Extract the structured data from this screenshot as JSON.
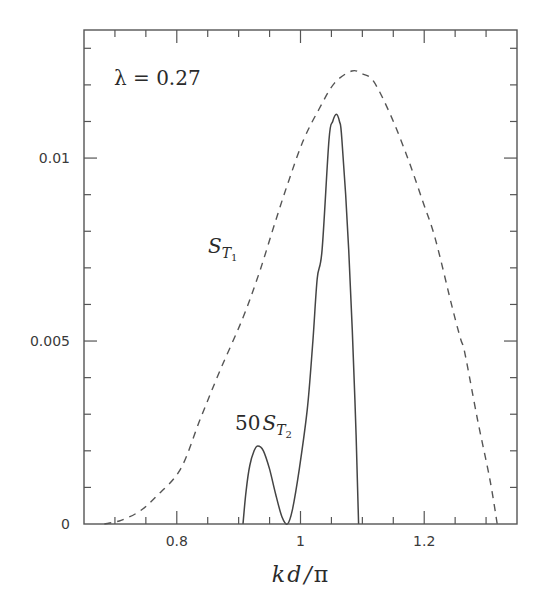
{
  "chart_data": {
    "type": "line",
    "title": "",
    "annotation": "λ = 0.27",
    "xlabel": "kd/π",
    "ylabel": "",
    "xlim": [
      0.65,
      1.35
    ],
    "ylim": [
      0,
      0.0135
    ],
    "grid": false,
    "legend": "none (inline curve labels)",
    "x_major_ticks": [
      0.8,
      1.0,
      1.2
    ],
    "x_tick_labels": [
      "0.8",
      "1",
      "1.2"
    ],
    "x_minor_step": 0.05,
    "y_major_ticks": [
      0,
      0.005,
      0.01
    ],
    "y_tick_labels": [
      "0",
      "0.005",
      "0.01"
    ],
    "y_minor_step": 0.001,
    "series": [
      {
        "name": "S_T1",
        "label_main": "S",
        "label_sub_letter": "T",
        "label_sub_index": "1",
        "style": "dashed",
        "points": [
          [
            0.683,
            0.0
          ],
          [
            0.71,
            0.0001
          ],
          [
            0.74,
            0.00035
          ],
          [
            0.766,
            0.00074
          ],
          [
            0.806,
            0.0015
          ],
          [
            0.838,
            0.00287
          ],
          [
            0.87,
            0.0042
          ],
          [
            0.906,
            0.0056
          ],
          [
            0.934,
            0.0069
          ],
          [
            0.96,
            0.0083
          ],
          [
            0.982,
            0.00943
          ],
          [
            1.005,
            0.0105
          ],
          [
            1.03,
            0.01134
          ],
          [
            1.055,
            0.01205
          ],
          [
            1.083,
            0.01238
          ],
          [
            1.1,
            0.0123
          ],
          [
            1.118,
            0.0121
          ],
          [
            1.145,
            0.0112
          ],
          [
            1.174,
            0.00997
          ],
          [
            1.198,
            0.0088
          ],
          [
            1.218,
            0.00779
          ],
          [
            1.246,
            0.00587
          ],
          [
            1.259,
            0.00505
          ],
          [
            1.266,
            0.00465
          ],
          [
            1.286,
            0.00287
          ],
          [
            1.306,
            0.00123
          ],
          [
            1.318,
            0.0
          ]
        ]
      },
      {
        "name": "50 S_T2",
        "label_coef": "50",
        "label_main": "S",
        "label_sub_letter": "T",
        "label_sub_index": "2",
        "style": "solid",
        "points": [
          [
            0.907,
            0.0
          ],
          [
            0.912,
            0.0009
          ],
          [
            0.918,
            0.0016
          ],
          [
            0.925,
            0.002
          ],
          [
            0.931,
            0.00213
          ],
          [
            0.94,
            0.002
          ],
          [
            0.95,
            0.0015
          ],
          [
            0.96,
            0.0008
          ],
          [
            0.97,
            0.0002
          ],
          [
            0.979,
            0.0
          ],
          [
            0.987,
            0.0004
          ],
          [
            0.998,
            0.0015
          ],
          [
            1.011,
            0.00314
          ],
          [
            1.02,
            0.005
          ],
          [
            1.027,
            0.0067
          ],
          [
            1.035,
            0.0075
          ],
          [
            1.046,
            0.0105
          ],
          [
            1.052,
            0.011
          ],
          [
            1.058,
            0.0112
          ],
          [
            1.063,
            0.011
          ],
          [
            1.067,
            0.0105
          ],
          [
            1.078,
            0.0075
          ],
          [
            1.088,
            0.0034
          ],
          [
            1.094,
            0.0
          ]
        ]
      }
    ]
  },
  "labels": {
    "annotation": "λ = 0.27",
    "xlabel_k": "k",
    "xlabel_d": "d",
    "xlabel_slash": "/",
    "xlabel_pi": "π",
    "s1_main": "S",
    "s1_sub": "T",
    "s1_idx": "1",
    "s2_coef": "50",
    "s2_main": "S",
    "s2_sub": "T",
    "s2_idx": "2"
  }
}
